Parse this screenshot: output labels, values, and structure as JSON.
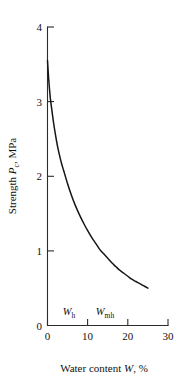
{
  "chart_data": {
    "type": "line",
    "title": "",
    "xlabel": "Water content W, %",
    "ylabel": "Strength Pc, MPa",
    "xlabel_parts": {
      "text_before": "Water content ",
      "symbol": "W",
      "text_after": ", %"
    },
    "ylabel_parts": {
      "text_before": "Strength ",
      "symbol": "P",
      "subscript": "c",
      "text_after": ", MPa"
    },
    "xlim": [
      0,
      30
    ],
    "ylim": [
      0,
      4
    ],
    "xticks": [
      0,
      10,
      20,
      30
    ],
    "yticks": [
      0,
      1,
      2,
      3,
      4
    ],
    "xtick_labels": [
      "0",
      "10",
      "20",
      "30"
    ],
    "ytick_labels": [
      "0",
      "1",
      "2",
      "3",
      "4"
    ],
    "grid": false,
    "legend": false,
    "spines": [
      "left",
      "bottom"
    ],
    "tick_direction": "in",
    "series": [
      {
        "name": "Strength vs water content",
        "color": "#151515",
        "x": [
          0.0,
          0.3,
          0.7,
          1.0,
          1.5,
          2.0,
          2.5,
          3.0,
          3.5,
          4.0,
          5.0,
          6.0,
          7.0,
          8.0,
          9.0,
          10.0,
          11.0,
          12.0,
          13.0,
          14.0,
          15.0,
          16.0,
          17.0,
          18.0,
          19.0,
          20.0,
          21.0,
          22.0,
          23.0,
          24.0,
          25.0
        ],
        "y": [
          3.55,
          3.3,
          3.05,
          2.92,
          2.72,
          2.55,
          2.4,
          2.28,
          2.17,
          2.08,
          1.9,
          1.74,
          1.6,
          1.48,
          1.37,
          1.27,
          1.18,
          1.1,
          1.02,
          0.96,
          0.9,
          0.84,
          0.79,
          0.74,
          0.7,
          0.66,
          0.62,
          0.59,
          0.56,
          0.53,
          0.5
        ]
      }
    ],
    "annotations": [
      {
        "name": "w-h",
        "symbol": "W",
        "subscript": "h",
        "x": 7.0,
        "y": 0.28
      },
      {
        "name": "w-mh",
        "symbol": "W",
        "subscript": "mh",
        "x": 14.0,
        "y": 0.28
      }
    ]
  }
}
